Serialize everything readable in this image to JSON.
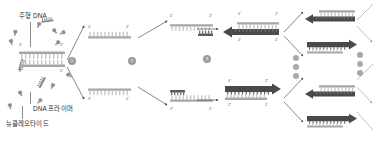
{
  "diagram": {
    "title_semantic": "PCR polymerase chain reaction cycle diagram",
    "labels": {
      "template_dna": "주형 DNA",
      "dna_primer": "DNA 프라이머",
      "nucleotide": "뉴클레오타이드"
    },
    "end_marks": {
      "five": "5'",
      "three": "3'"
    },
    "steps": [
      {
        "id": "step-1",
        "number": "1",
        "x": 68,
        "y": 57
      },
      {
        "id": "step-2",
        "number": "2",
        "x": 128,
        "y": 57
      },
      {
        "id": "step-3",
        "number": "3",
        "x": 203,
        "y": 55
      }
    ],
    "repeat_dots_left": [
      "",
      "",
      ""
    ],
    "repeat_dots_right": [
      "",
      "",
      ""
    ],
    "colors": {
      "template_strand": "#a6a6a6",
      "new_strand": "#4a4a4a",
      "teeth": "#c9c9c9",
      "step_badge": "#9d9d9d",
      "text": "#2b2b2b",
      "leader": "#8a8a8a",
      "arrow_thin": "#555555"
    },
    "duplex_origin": {
      "top_left_end": "5'",
      "top_right_end": "3'",
      "bottom_left_end": "3'",
      "bottom_right_end": "5'"
    },
    "denatured": [
      {
        "name": "upper-single-strand",
        "left_end": "5'",
        "right_end": "3'"
      },
      {
        "name": "lower-single-strand",
        "left_end": "3'",
        "right_end": "5'"
      }
    ],
    "annealed": [
      {
        "name": "upper-annealed",
        "template_left": "5'",
        "template_right": "3'"
      },
      {
        "name": "lower-annealed",
        "template_left": "3'",
        "template_right": "5'"
      }
    ],
    "extended": [
      {
        "name": "upper-extended",
        "top_left": "5'",
        "top_right": "3'",
        "bottom_left": "3'",
        "bottom_right": "5'",
        "direction": "left"
      },
      {
        "name": "lower-extended",
        "top_left": "5'",
        "top_right": "3'",
        "bottom_left": "3'",
        "bottom_right": "5'",
        "direction": "right"
      }
    ],
    "products": [
      {
        "name": "product-1",
        "direction": "left"
      },
      {
        "name": "product-2",
        "direction": "right"
      },
      {
        "name": "product-3",
        "direction": "left"
      },
      {
        "name": "product-4",
        "direction": "right"
      }
    ]
  }
}
